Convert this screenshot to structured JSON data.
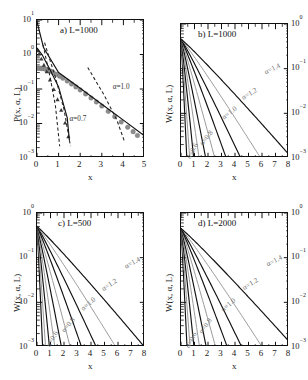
{
  "figure": {
    "kind": "multi-panel-figure",
    "panel_count": 4,
    "layout": "2x2"
  },
  "axis_text": {
    "x_label": "x",
    "y_label_p": "P(x, α, L)",
    "y_label_w": "W(x, α, L)",
    "decade_labels_4": [
      "10",
      "10",
      "10",
      "10"
    ],
    "exp_a": [
      "1",
      "0",
      "-1",
      "-2",
      "-3"
    ],
    "exp_w": [
      "0",
      "-1",
      "-2",
      "-3"
    ]
  },
  "chart_data": [
    {
      "id": "panel-a",
      "type": "line",
      "title": "a) L=1000",
      "panel_letter": "a",
      "L": 1000,
      "xlabel": "x",
      "ylabel": "P(x, α, L)",
      "xlim": [
        0,
        5
      ],
      "ylim": [
        0.001,
        10
      ],
      "yscale": "log",
      "xscale": "linear",
      "xticks": [
        0,
        1,
        2,
        3,
        4,
        5
      ],
      "xticklabels": [
        "0",
        "1",
        "2",
        "3",
        "4",
        "5"
      ],
      "yticks": [
        10,
        1,
        0.1,
        0.01,
        0.001
      ],
      "yticklabels": [
        "10^1",
        "10^0",
        "10^-1",
        "10^-2",
        "10^-3"
      ],
      "ytick_side": "left",
      "grid": false,
      "legend": "none",
      "annotations": [
        {
          "text": "α=1.0",
          "x": 3.55,
          "y": 0.105,
          "rotation": 0
        },
        {
          "text": "α=0.7",
          "x": 1.55,
          "y": 0.0125,
          "rotation": 0
        }
      ],
      "series": [
        {
          "name": "alpha=1.0 data",
          "style": "markers",
          "marker": "circle-gray",
          "x": [
            0.02,
            0.08,
            0.15,
            0.22,
            0.3,
            0.4,
            0.5,
            0.62,
            0.75,
            0.9,
            1.05,
            1.2,
            1.4,
            1.6,
            1.8,
            2.0,
            2.25,
            2.5,
            2.75,
            3.0,
            3.3,
            3.6,
            3.9,
            4.2,
            4.45,
            4.65
          ],
          "y": [
            0.4,
            0.4,
            0.4,
            0.395,
            0.39,
            0.375,
            0.355,
            0.33,
            0.3,
            0.265,
            0.235,
            0.205,
            0.17,
            0.14,
            0.115,
            0.094,
            0.072,
            0.055,
            0.042,
            0.032,
            0.0225,
            0.0158,
            0.0111,
            0.0078,
            0.0058,
            0.0045
          ]
        },
        {
          "name": "alpha=1.0 fit",
          "style": "solid",
          "x": [
            0.0,
            0.3,
            1.0,
            2.0,
            3.0,
            4.0,
            5.0
          ],
          "y": [
            9.0,
            1.6,
            0.3,
            0.105,
            0.036,
            0.0125,
            0.0043
          ]
        },
        {
          "name": "alpha=0.7 data",
          "style": "markers",
          "marker": "triangle-dark",
          "x": [
            0.03,
            0.1,
            0.2,
            0.32,
            0.45,
            0.6,
            0.78,
            0.95,
            1.12,
            1.3,
            1.45
          ],
          "y": [
            1.3,
            1.05,
            0.75,
            0.5,
            0.32,
            0.185,
            0.098,
            0.05,
            0.0245,
            0.0105,
            0.0042
          ]
        },
        {
          "name": "alpha=0.7 fit",
          "style": "solid",
          "x": [
            0.0,
            0.25,
            0.6,
            1.0,
            1.4,
            1.5
          ],
          "y": [
            1.55,
            0.95,
            0.37,
            0.115,
            0.0145,
            0.0032
          ]
        },
        {
          "name": "asymptote-1",
          "style": "dashed",
          "x": [
            0.28,
            0.6,
            0.85,
            1.05
          ],
          "y": [
            1.9,
            0.23,
            0.034,
            0.0022
          ]
        },
        {
          "name": "asymptote-2",
          "style": "dashed",
          "x": [
            0.35,
            0.85,
            1.25,
            1.55
          ],
          "y": [
            2.2,
            0.22,
            0.0255,
            0.0022
          ]
        },
        {
          "name": "asymptote-3",
          "style": "dashed",
          "x": [
            2.35,
            3.1,
            3.7,
            4.05
          ],
          "y": [
            0.42,
            0.068,
            0.0125,
            0.003
          ]
        }
      ]
    },
    {
      "id": "panel-b",
      "type": "line",
      "title": "b) L=1000",
      "panel_letter": "b",
      "L": 1000,
      "xlabel": "x",
      "ylabel": "W(x, α, L)",
      "xlim": [
        0,
        8
      ],
      "ylim": [
        0.001,
        1
      ],
      "yscale": "log",
      "xscale": "linear",
      "xticks": [
        0,
        1,
        2,
        3,
        4,
        5,
        6,
        7,
        8
      ],
      "xticklabels": [
        "0",
        "1",
        "2",
        "3",
        "4",
        "5",
        "6",
        "7",
        "8"
      ],
      "yticks": [
        1,
        0.1,
        0.01,
        0.001
      ],
      "yticklabels": [
        "10^0",
        "10^-1",
        "10^-2",
        "10^-3"
      ],
      "ytick_side": "right",
      "grid": false,
      "legend": "none",
      "annotations": [
        {
          "text": "α=1.4",
          "x": 6.25,
          "y": 0.093,
          "rotation": -26
        },
        {
          "text": "α=1.2",
          "x": 4.55,
          "y": 0.0255,
          "rotation": -31
        },
        {
          "text": "α=1.0",
          "x": 3.05,
          "y": 0.0095,
          "rotation": -38
        },
        {
          "text": "α=0.8",
          "x": 1.35,
          "y": 0.0026,
          "rotation": -52
        },
        {
          "text": "α=0.6",
          "x": 0.32,
          "y": 0.00135,
          "rotation": -62
        }
      ],
      "series": [
        {
          "name": "alpha=0.5",
          "style": "solid",
          "decay_x0": 0.48,
          "y0": 0.46
        },
        {
          "name": "alpha=0.6",
          "style": "gray",
          "decay_x0": 0.72,
          "y0": 0.46
        },
        {
          "name": "alpha=0.7",
          "style": "solid",
          "decay_x0": 1.05,
          "y0": 0.46
        },
        {
          "name": "alpha=0.8",
          "style": "gray",
          "decay_x0": 1.5,
          "y0": 0.46
        },
        {
          "name": "alpha=0.9",
          "style": "solid",
          "decay_x0": 2.05,
          "y0": 0.46
        },
        {
          "name": "alpha=1.0",
          "style": "gray",
          "decay_x0": 2.8,
          "y0": 0.46
        },
        {
          "name": "alpha=1.1",
          "style": "solid",
          "decay_x0": 3.75,
          "y0": 0.46
        },
        {
          "name": "alpha=1.2",
          "style": "solid",
          "decay_x0": 4.95,
          "y0": 0.46
        },
        {
          "name": "alpha=1.3",
          "style": "gray",
          "decay_x0": 6.6,
          "y0": 0.46
        },
        {
          "name": "alpha=1.4",
          "style": "solid",
          "decay_x0": 9.2,
          "y0": 0.46
        }
      ]
    },
    {
      "id": "panel-c",
      "type": "line",
      "title": "c) L=500",
      "panel_letter": "c",
      "L": 500,
      "xlabel": "x",
      "ylabel": "W(x, α, L)",
      "xlim": [
        0,
        8
      ],
      "ylim": [
        0.001,
        1
      ],
      "yscale": "log",
      "xscale": "linear",
      "xticks": [
        0,
        1,
        2,
        3,
        4,
        5,
        6,
        7,
        8
      ],
      "xticklabels": [
        "0",
        "1",
        "2",
        "3",
        "4",
        "5",
        "6",
        "7",
        "8"
      ],
      "yticks": [
        1,
        0.1,
        0.01,
        0.001
      ],
      "yticklabels": [
        "10^0",
        "10^-1",
        "10^-2",
        "10^-3"
      ],
      "ytick_side": "left",
      "grid": false,
      "legend": "none",
      "annotations": [
        {
          "text": "α=1.4",
          "x": 6.55,
          "y": 0.072,
          "rotation": -28
        },
        {
          "text": "α=1.2",
          "x": 4.85,
          "y": 0.0235,
          "rotation": -33
        },
        {
          "text": "α=1.0",
          "x": 3.25,
          "y": 0.0088,
          "rotation": -40
        },
        {
          "text": "α=0.8",
          "x": 1.75,
          "y": 0.003,
          "rotation": -50
        },
        {
          "text": "α=0.6",
          "x": 0.6,
          "y": 0.00145,
          "rotation": -60
        }
      ],
      "series": [
        {
          "name": "alpha=0.5",
          "style": "solid",
          "decay_x0": 0.46,
          "y0": 0.5
        },
        {
          "name": "alpha=0.6",
          "style": "gray",
          "decay_x0": 0.7,
          "y0": 0.5
        },
        {
          "name": "alpha=0.7",
          "style": "solid",
          "decay_x0": 1.02,
          "y0": 0.5
        },
        {
          "name": "alpha=0.8",
          "style": "gray",
          "decay_x0": 1.46,
          "y0": 0.5
        },
        {
          "name": "alpha=0.9",
          "style": "solid",
          "decay_x0": 2.0,
          "y0": 0.5
        },
        {
          "name": "alpha=1.0",
          "style": "gray",
          "decay_x0": 2.72,
          "y0": 0.5
        },
        {
          "name": "alpha=1.1",
          "style": "solid",
          "decay_x0": 3.65,
          "y0": 0.5
        },
        {
          "name": "alpha=1.2",
          "style": "solid",
          "decay_x0": 4.85,
          "y0": 0.5
        },
        {
          "name": "alpha=1.3",
          "style": "gray",
          "decay_x0": 6.45,
          "y0": 0.5
        },
        {
          "name": "alpha=1.4",
          "style": "solid",
          "decay_x0": 8.8,
          "y0": 0.5
        }
      ]
    },
    {
      "id": "panel-d",
      "type": "line",
      "title": "d) L=2000",
      "panel_letter": "d",
      "L": 2000,
      "xlabel": "x",
      "ylabel": "W(x, α, L)",
      "xlim": [
        0,
        8
      ],
      "ylim": [
        0.001,
        1
      ],
      "yscale": "log",
      "xscale": "linear",
      "xticks": [
        0,
        1,
        2,
        3,
        4,
        5,
        6,
        7,
        8
      ],
      "xticklabels": [
        "0",
        "1",
        "2",
        "3",
        "4",
        "5",
        "6",
        "7",
        "8"
      ],
      "yticks": [
        1,
        0.1,
        0.01,
        0.001
      ],
      "yticklabels": [
        "10^0",
        "10^-1",
        "10^-2",
        "10^-3"
      ],
      "ytick_side": "right",
      "grid": false,
      "legend": "none",
      "annotations": [
        {
          "text": "α=1.4",
          "x": 6.35,
          "y": 0.082,
          "rotation": -27
        },
        {
          "text": "α=1.2",
          "x": 4.6,
          "y": 0.0245,
          "rotation": -32
        },
        {
          "text": "α=1.0",
          "x": 2.95,
          "y": 0.0082,
          "rotation": -40
        },
        {
          "text": "α=0.8",
          "x": 1.25,
          "y": 0.0028,
          "rotation": -53
        },
        {
          "text": "α=0.6",
          "x": 0.22,
          "y": 0.00135,
          "rotation": -63
        }
      ],
      "series": [
        {
          "name": "alpha=0.5",
          "style": "solid",
          "decay_x0": 0.5,
          "y0": 0.45
        },
        {
          "name": "alpha=0.6",
          "style": "gray",
          "decay_x0": 0.75,
          "y0": 0.45
        },
        {
          "name": "alpha=0.7",
          "style": "solid",
          "decay_x0": 1.08,
          "y0": 0.45
        },
        {
          "name": "alpha=0.8",
          "style": "gray",
          "decay_x0": 1.54,
          "y0": 0.45
        },
        {
          "name": "alpha=0.9",
          "style": "solid",
          "decay_x0": 2.1,
          "y0": 0.45
        },
        {
          "name": "alpha=1.0",
          "style": "gray",
          "decay_x0": 2.88,
          "y0": 0.45
        },
        {
          "name": "alpha=1.1",
          "style": "solid",
          "decay_x0": 3.85,
          "y0": 0.45
        },
        {
          "name": "alpha=1.2",
          "style": "solid",
          "decay_x0": 5.05,
          "y0": 0.45
        },
        {
          "name": "alpha=1.3",
          "style": "gray",
          "decay_x0": 6.75,
          "y0": 0.45
        },
        {
          "name": "alpha=1.4",
          "style": "solid",
          "decay_x0": 9.4,
          "y0": 0.45
        }
      ]
    }
  ],
  "colors": {
    "ink": "#111111",
    "gray_curve": "#9a9a9a",
    "marker_gray": "#8d8d8d",
    "background": "#ffffff"
  }
}
